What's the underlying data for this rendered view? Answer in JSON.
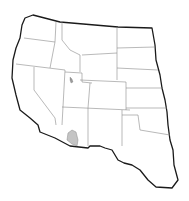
{
  "map": {
    "title": "Western United States range map",
    "region": "Western United States",
    "highlighted_range": {
      "label": "Range area",
      "location": "Southern Arizona",
      "color": "#c4c4c4"
    },
    "outline_color": "#1a1a1a",
    "state_border_color": "#8a8a8a",
    "states": [
      "Washington",
      "Oregon",
      "California",
      "Idaho",
      "Nevada",
      "Utah",
      "Arizona",
      "Montana",
      "Wyoming",
      "Colorado",
      "New Mexico",
      "North Dakota",
      "South Dakota",
      "Nebraska",
      "Kansas",
      "Oklahoma",
      "Texas"
    ]
  }
}
